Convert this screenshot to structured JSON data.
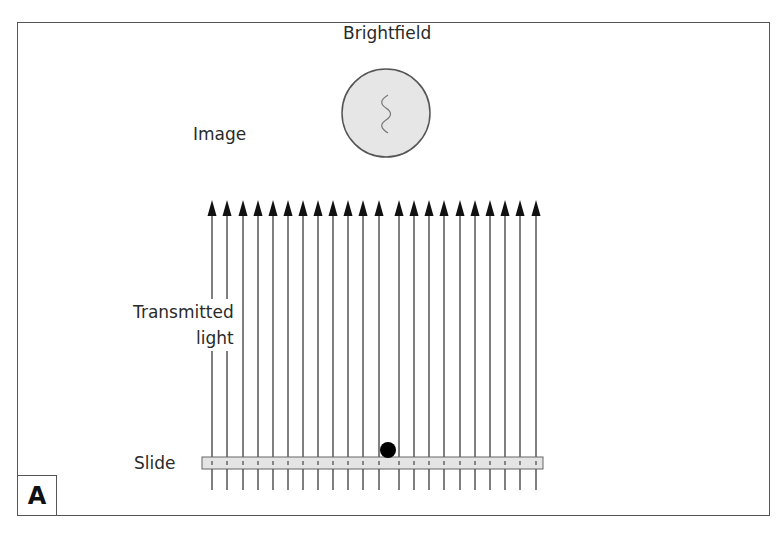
{
  "panel_label": "A",
  "title": "Brightfield",
  "labels": {
    "image": "Image",
    "transmitted_line1": "Transmitted",
    "transmitted_line2": "light",
    "slide": "Slide"
  },
  "colors": {
    "frame": "#555555",
    "image_circle_fill": "#e6e6e6",
    "slide_fill": "#e4e4e4",
    "arrow": "#111111",
    "line": "#555555",
    "specimen_dot": "#000000"
  },
  "arrows_x": [
    212,
    227,
    243,
    258,
    273,
    288,
    303,
    318,
    333,
    348,
    363,
    379,
    399,
    414,
    429,
    444,
    460,
    475,
    490,
    505,
    520,
    536
  ],
  "specimen": {
    "x": 388,
    "y": 450,
    "r": 8
  }
}
